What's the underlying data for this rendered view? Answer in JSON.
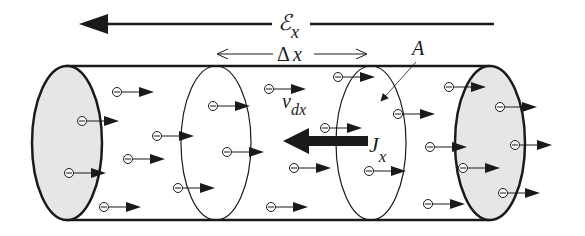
{
  "diagram": {
    "labels": {
      "field": "ℰ",
      "field_sub": "x",
      "delta": "Δ",
      "delta_var": "x",
      "area": "A",
      "drift_velocity": "v",
      "drift_velocity_sub": "dx",
      "current_density": "J",
      "current_density_sub": "x"
    },
    "colors": {
      "stroke": "#1a1a1a",
      "end_cap_fill": "#e6e6e6",
      "background": "#ffffff"
    },
    "electrons": [
      {
        "x": 117,
        "y": 92
      },
      {
        "x": 82,
        "y": 121
      },
      {
        "x": 157,
        "y": 136
      },
      {
        "x": 128,
        "y": 159
      },
      {
        "x": 69,
        "y": 173
      },
      {
        "x": 178,
        "y": 188
      },
      {
        "x": 104,
        "y": 207
      },
      {
        "x": 213,
        "y": 106
      },
      {
        "x": 269,
        "y": 89
      },
      {
        "x": 338,
        "y": 77
      },
      {
        "x": 227,
        "y": 152
      },
      {
        "x": 325,
        "y": 128
      },
      {
        "x": 294,
        "y": 168
      },
      {
        "x": 271,
        "y": 207
      },
      {
        "x": 369,
        "y": 171
      },
      {
        "x": 449,
        "y": 87
      },
      {
        "x": 398,
        "y": 114
      },
      {
        "x": 500,
        "y": 107
      },
      {
        "x": 430,
        "y": 147
      },
      {
        "x": 515,
        "y": 145
      },
      {
        "x": 463,
        "y": 168
      },
      {
        "x": 503,
        "y": 193
      },
      {
        "x": 428,
        "y": 204
      }
    ]
  }
}
